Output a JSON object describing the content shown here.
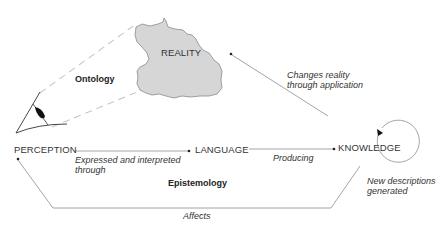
{
  "nodes": {
    "reality": "REALITY",
    "perception": "PERCEPTION",
    "language": "LANGUAGE",
    "knowledge": "KNOWLEDGE"
  },
  "areas": {
    "ontology": "Ontology",
    "epistemology": "Epistemology"
  },
  "edges": {
    "perception_to_language": [
      "Expressed and interpreted",
      "through"
    ],
    "language_to_knowledge": "Producing",
    "knowledge_to_reality": [
      "Changes reality",
      "through application"
    ],
    "knowledge_self_loop": [
      "New descriptions",
      "generated"
    ],
    "knowledge_to_perception": "Affects"
  },
  "colors": {
    "reality_fill": "#d6d6d6",
    "reality_stroke": "#8a8a8a",
    "line": "#9a9a9a",
    "dashed": "#c4c4c4",
    "text": "#2a2a2a"
  }
}
